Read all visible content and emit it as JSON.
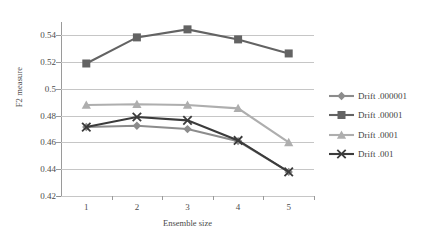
{
  "chart_data": {
    "type": "line",
    "title": "",
    "xlabel": "Ensemble size",
    "ylabel": "F2 measure",
    "categories": [
      1,
      2,
      3,
      4,
      5
    ],
    "x": [
      1,
      2,
      3,
      4,
      5
    ],
    "xlim": [
      0.5,
      5.5
    ],
    "ylim": [
      0.42,
      0.55
    ],
    "yticks": [
      0.42,
      0.44,
      0.46,
      0.48,
      0.5,
      0.52,
      0.54
    ],
    "ytick_labels": [
      "0.42",
      "0.44",
      "0.46",
      "0.48",
      "0.5",
      "0.52",
      "0.54"
    ],
    "xtick_labels": [
      "1",
      "2",
      "3",
      "4",
      "5"
    ],
    "grid": "horizontal",
    "legend_position": "right",
    "series": [
      {
        "name": "Drift .000001",
        "marker": "diamond",
        "color": "#8c8c8c",
        "values": [
          0.4715,
          0.4725,
          0.47,
          0.461,
          0.438
        ]
      },
      {
        "name": "Drift .00001",
        "marker": "square",
        "color": "#636363",
        "values": [
          0.519,
          0.5385,
          0.5445,
          0.537,
          0.5265
        ]
      },
      {
        "name": "Drift .0001",
        "marker": "triangle",
        "color": "#aeaeae",
        "values": [
          0.488,
          0.4885,
          0.488,
          0.4855,
          0.46
        ]
      },
      {
        "name": "Drift .001",
        "marker": "x",
        "color": "#3b3b3b",
        "values": [
          0.4715,
          0.479,
          0.4765,
          0.4615,
          0.438
        ]
      }
    ]
  },
  "legend": {
    "items": [
      {
        "label": "Drift .000001"
      },
      {
        "label": "Drift .00001"
      },
      {
        "label": "Drift .0001"
      },
      {
        "label": "Drift .001"
      }
    ]
  },
  "axes": {
    "y_title": "F2 measure",
    "x_title": "Ensemble size"
  },
  "colors": {
    "gridline": "#c6c6c6",
    "axis": "#9a9a9a",
    "text": "#4d4d4d"
  }
}
